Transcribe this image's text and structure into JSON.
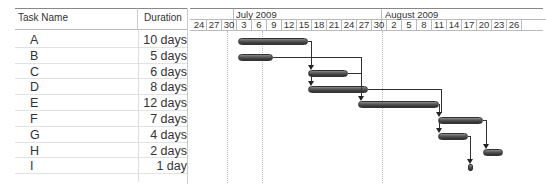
{
  "table": {
    "columns": [
      "Task Name",
      "Duration"
    ],
    "rows": [
      {
        "name": "A",
        "duration": "10 days"
      },
      {
        "name": "B",
        "duration": "5 days"
      },
      {
        "name": "C",
        "duration": "6 days"
      },
      {
        "name": "D",
        "duration": "8 days"
      },
      {
        "name": "E",
        "duration": "12 days"
      },
      {
        "name": "F",
        "duration": "7 days"
      },
      {
        "name": "G",
        "duration": "4 days"
      },
      {
        "name": "H",
        "duration": "2 days"
      },
      {
        "name": "I",
        "duration": "1 day"
      }
    ]
  },
  "timescale": {
    "months": [
      "July 2009",
      "August 2009"
    ],
    "ticks": [
      "24",
      "27",
      "30",
      "3",
      "6",
      "9",
      "12",
      "15",
      "18",
      "21",
      "24",
      "27",
      "30",
      "2",
      "5",
      "8",
      "11",
      "14",
      "17",
      "20",
      "23",
      "26"
    ]
  },
  "colors": {
    "bar": "#4a4a4a",
    "link": "#333333",
    "grid": "#bbbbbb"
  }
}
